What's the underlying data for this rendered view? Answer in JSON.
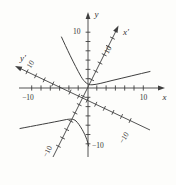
{
  "figure": {
    "background": "#fdfdfb",
    "ink": "#3f3f3f",
    "labels": {
      "x_axis": "x",
      "y_axis": "y",
      "x_prime_axis": "x′",
      "y_prime_axis": "y′",
      "x_pos_tick": "10",
      "x_neg_tick": "−10",
      "y_pos_tick": "10",
      "y_neg_tick": "−10",
      "x_prime_pos_tick": "10",
      "x_prime_neg_tick": "−10",
      "y_prime_pos_tick": "10",
      "y_prime_neg_tick": "−10"
    }
  },
  "chart_data": {
    "type": "line",
    "title": "",
    "xlabel": "x",
    "ylabel": "y",
    "x_range": [
      -13,
      13
    ],
    "y_range": [
      -14,
      14
    ],
    "tick_step": 2,
    "labeled_ticks": [
      -10,
      10
    ],
    "grid": false,
    "legend": false,
    "rotated_axes": {
      "x_prime_label": "x′",
      "y_prime_label": "y′",
      "x_prime_angle_deg": 63,
      "y_prime_angle_deg": 153,
      "labeled_ticks": [
        -10,
        10
      ]
    },
    "series": [
      {
        "name": "hyperbola upper branch",
        "points": [
          [
            -4.6,
            9.4
          ],
          [
            -3.6,
            7.4
          ],
          [
            -2.8,
            5.5
          ],
          [
            -1.9,
            3.7
          ],
          [
            -1.0,
            2.0
          ],
          [
            -0.2,
            1.1
          ],
          [
            0.7,
            0.7
          ],
          [
            2.2,
            1.0
          ],
          [
            4.0,
            1.5
          ],
          [
            6.3,
            2.1
          ],
          [
            8.8,
            2.6
          ],
          [
            11.2,
            3.0
          ]
        ]
      },
      {
        "name": "hyperbola lower branch",
        "points": [
          [
            -12.1,
            -7.4
          ],
          [
            -9.7,
            -7.0
          ],
          [
            -7.2,
            -6.5
          ],
          [
            -4.9,
            -6.0
          ],
          [
            -2.9,
            -5.7
          ],
          [
            -1.7,
            -6.4
          ],
          [
            -0.8,
            -7.7
          ],
          [
            -0.2,
            -9.2
          ],
          [
            0.2,
            -10.7
          ]
        ]
      }
    ]
  }
}
